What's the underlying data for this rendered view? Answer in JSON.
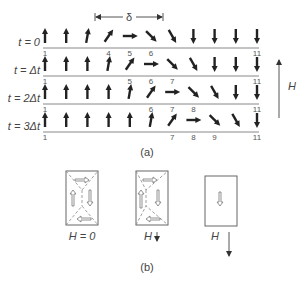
{
  "figure": {
    "part_a": {
      "caption": "(a)",
      "delta_label": "δ",
      "field_label": "H",
      "rows": [
        {
          "label": "t = 0",
          "angles": [
            0,
            0,
            10,
            35,
            90,
            135,
            150,
            180,
            180,
            180,
            180
          ],
          "ticks": [
            "1",
            "4",
            "5",
            "6",
            "11"
          ],
          "tick_positions": [
            1,
            4,
            5,
            6,
            11
          ]
        },
        {
          "label": "t = Δt",
          "angles": [
            0,
            0,
            0,
            10,
            35,
            90,
            135,
            150,
            180,
            180,
            180
          ],
          "ticks": [
            "1",
            "5",
            "6",
            "7",
            "11"
          ],
          "tick_positions": [
            1,
            5,
            6,
            7,
            11
          ]
        },
        {
          "label": "t = 2Δt",
          "angles": [
            0,
            0,
            0,
            0,
            10,
            35,
            90,
            135,
            150,
            180,
            180
          ],
          "ticks": [
            "1",
            "6",
            "7",
            "8",
            "11"
          ],
          "tick_positions": [
            1,
            6,
            7,
            8,
            11
          ]
        },
        {
          "label": "t = 3Δt",
          "angles": [
            0,
            0,
            0,
            0,
            0,
            10,
            35,
            90,
            135,
            150,
            180
          ],
          "ticks": [
            "1",
            "7",
            "8",
            "9",
            "11"
          ],
          "tick_positions": [
            1,
            7,
            8,
            9,
            11
          ]
        }
      ]
    },
    "part_b": {
      "caption": "(b)",
      "panels": [
        {
          "label": "H = 0"
        },
        {
          "label": "H"
        },
        {
          "label": "H"
        }
      ]
    }
  }
}
